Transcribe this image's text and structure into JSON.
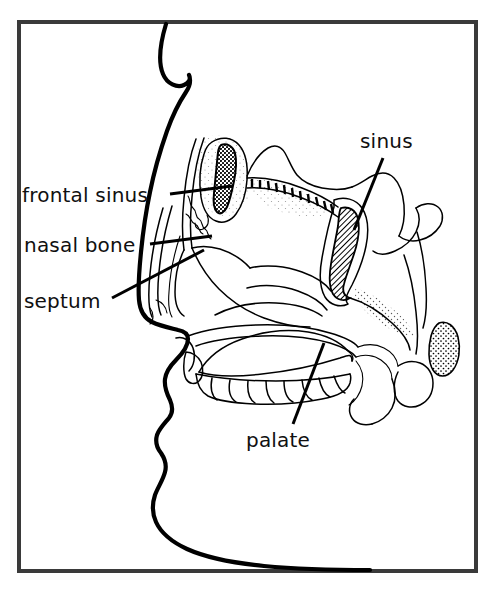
{
  "figure": {
    "background_color": "#ffffff",
    "frame_color": "#3a3a3a",
    "ink_color": "#000000"
  },
  "labels": [
    {
      "id": "frontal-sinus",
      "text": "frontal sinus",
      "x": 22,
      "y": 202,
      "anchor": "start",
      "leader": {
        "x1": 170,
        "y1": 194,
        "x2": 232,
        "y2": 186
      }
    },
    {
      "id": "nasal-bone",
      "text": "nasal bone",
      "x": 24,
      "y": 252,
      "anchor": "start",
      "leader": {
        "x1": 150,
        "y1": 244,
        "x2": 212,
        "y2": 236
      }
    },
    {
      "id": "septum",
      "text": "septum",
      "x": 24,
      "y": 308,
      "anchor": "start",
      "leader": {
        "x1": 112,
        "y1": 298,
        "x2": 204,
        "y2": 250
      }
    },
    {
      "id": "sinus",
      "text": "sinus",
      "x": 360,
      "y": 148,
      "anchor": "start",
      "leader": {
        "x1": 383,
        "y1": 158,
        "x2": 354,
        "y2": 230
      }
    },
    {
      "id": "palate",
      "text": "palate",
      "x": 246,
      "y": 447,
      "anchor": "start",
      "leader": {
        "x1": 293,
        "y1": 424,
        "x2": 324,
        "y2": 343
      }
    }
  ],
  "structures": [
    {
      "id": "face-profile",
      "name": "face profile outline"
    },
    {
      "id": "frontal-sinus-cavity",
      "name": "frontal sinus cavity",
      "shading": "stipple-dark"
    },
    {
      "id": "maxillary-sinus-cavity",
      "name": "sinus cavity",
      "shading": "hatched-dark"
    },
    {
      "id": "cribriform-plate",
      "name": "cribriform plate serration"
    },
    {
      "id": "nasal-turbinates",
      "name": "nasal turbinates"
    },
    {
      "id": "nasal-septum",
      "name": "nasal septum"
    },
    {
      "id": "hard-palate",
      "name": "hard palate"
    },
    {
      "id": "tongue",
      "name": "tongue",
      "shading": "stipple-gradient"
    },
    {
      "id": "upper-teeth",
      "name": "upper teeth row",
      "count": 9
    },
    {
      "id": "soft-palate",
      "name": "soft palate and uvula"
    },
    {
      "id": "adenoid",
      "name": "adenoid / tonsil mass",
      "shading": "stipple-light"
    },
    {
      "id": "pharynx-wall",
      "name": "pharyngeal wall"
    }
  ],
  "frame": {
    "x": 17,
    "y": 20,
    "width": 461,
    "height": 553
  }
}
